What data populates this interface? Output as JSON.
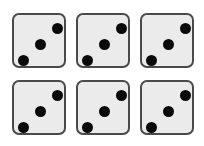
{
  "dice": [
    {
      "row": 1,
      "col": 1,
      "value": 3,
      "left": 12,
      "top": 13
    },
    {
      "row": 1,
      "col": 2,
      "value": 3,
      "left": 76,
      "top": 13
    },
    {
      "row": 1,
      "col": 3,
      "value": 3,
      "left": 140,
      "top": 13
    },
    {
      "row": 2,
      "col": 1,
      "value": 3,
      "left": 12,
      "top": 80
    },
    {
      "row": 2,
      "col": 2,
      "value": 3,
      "left": 76,
      "top": 80
    },
    {
      "row": 2,
      "col": 3,
      "value": 3,
      "left": 140,
      "top": 80
    }
  ],
  "colors": {
    "face": "#ebebeb",
    "border": "#4a4a4a",
    "pip": "#0a0a0a",
    "background": "#ffffff"
  }
}
